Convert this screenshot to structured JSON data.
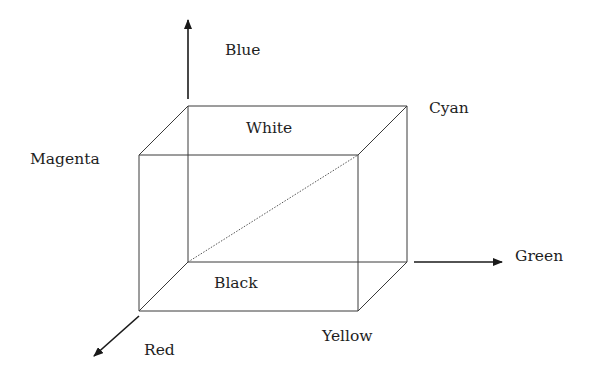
{
  "diagram": {
    "axes": [
      {
        "name": "blue",
        "label": "Blue",
        "direction": "up"
      },
      {
        "name": "green",
        "label": "Green",
        "direction": "right"
      },
      {
        "name": "red",
        "label": "Red",
        "direction": "down-left"
      }
    ],
    "vertices": {
      "white": "White",
      "magenta": "Magenta",
      "cyan": "Cyan",
      "black": "Black",
      "yellow": "Yellow"
    },
    "diagonal": {
      "from": "Black",
      "to": "White",
      "style": "dotted"
    },
    "colors": {
      "line": "#333333",
      "text": "#1e1e1e",
      "background": "#ffffff"
    }
  }
}
